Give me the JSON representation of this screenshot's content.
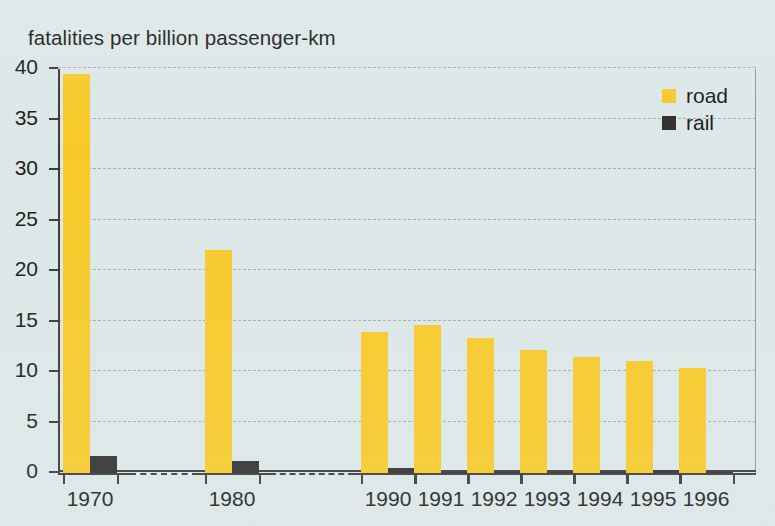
{
  "chart_data": {
    "type": "bar",
    "title": "fatalities per billion passenger-km",
    "xlabel": "",
    "ylabel": "",
    "ylim": [
      0,
      40
    ],
    "yticks": [
      0,
      5,
      10,
      15,
      20,
      25,
      30,
      35,
      40
    ],
    "grid": true,
    "axis_break": true,
    "legend_position": "top-right",
    "categories": [
      "1970",
      "1980",
      "1990",
      "1991",
      "1992",
      "1993",
      "1994",
      "1995",
      "1996"
    ],
    "series": [
      {
        "name": "road",
        "color": "#f7c928",
        "values": [
          39.5,
          22.1,
          14.0,
          14.7,
          13.4,
          12.2,
          11.5,
          11.1,
          10.4
        ]
      },
      {
        "name": "rail",
        "color": "#2f2f2f",
        "values": [
          1.7,
          1.2,
          0.45,
          0.05,
          0.05,
          0.05,
          0.05,
          0.25,
          0.15
        ]
      }
    ]
  },
  "legend": {
    "items": [
      {
        "label": "road",
        "swatch": "road-swatch-icon"
      },
      {
        "label": "rail",
        "swatch": "rail-swatch-icon"
      }
    ]
  },
  "colors": {
    "background": "#dce7e7",
    "road": "#f7c928",
    "rail": "#2f2f2f",
    "axis": "#3a3a3a",
    "text": "#1b1b1b"
  }
}
